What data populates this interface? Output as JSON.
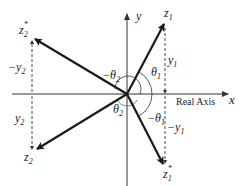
{
  "diagram": {
    "axes": {
      "x_label": "x",
      "y_label": "y",
      "real_axis_label": "Real Axis"
    },
    "points": {
      "z1": {
        "name": "z",
        "sub": "1",
        "sup": ""
      },
      "z1_conj": {
        "name": "z",
        "sub": "1",
        "sup": "*"
      },
      "z2": {
        "name": "z",
        "sub": "2",
        "sup": ""
      },
      "z2_conj": {
        "name": "z",
        "sub": "2",
        "sup": "*"
      }
    },
    "heights": {
      "y1": {
        "sign": "",
        "name": "y",
        "sub": "1"
      },
      "neg_y1": {
        "sign": "−",
        "name": "y",
        "sub": "1"
      },
      "y2": {
        "sign": "",
        "name": "y",
        "sub": "2"
      },
      "neg_y2": {
        "sign": "−",
        "name": "y",
        "sub": "2"
      }
    },
    "angles": {
      "theta1": {
        "sign": "",
        "name": "θ",
        "sub": "1"
      },
      "neg_theta1": {
        "sign": "−",
        "name": "θ",
        "sub": "1"
      },
      "theta2": {
        "sign": "",
        "name": "θ",
        "sub": "2"
      },
      "neg_theta2": {
        "sign": "−",
        "name": "θ",
        "sub": "2"
      }
    },
    "colors": {
      "ink": "#1a1a1a",
      "axis": "#333333",
      "arc_theta2": "#2e7d32"
    }
  }
}
